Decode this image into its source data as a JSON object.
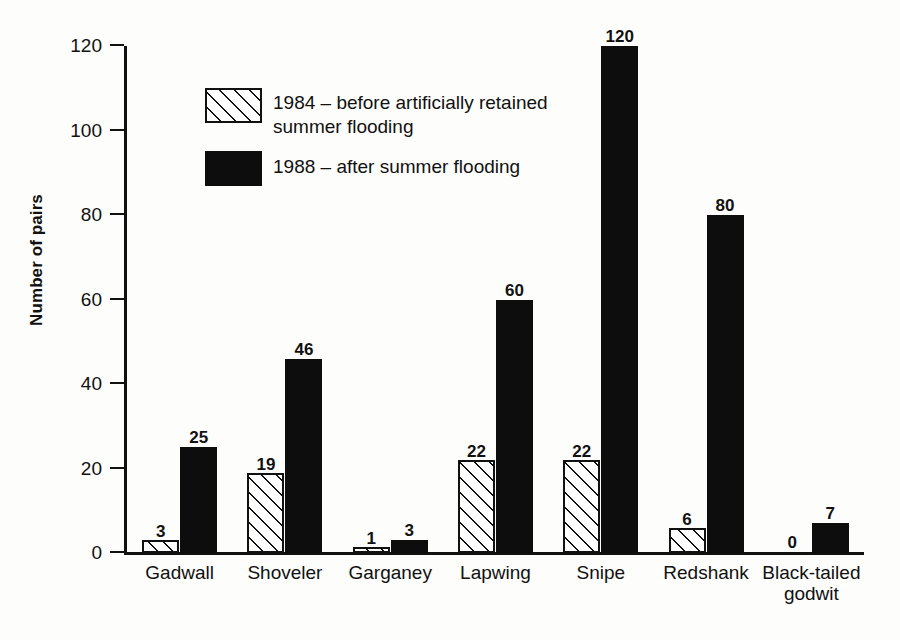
{
  "chart_data": {
    "type": "bar",
    "title": "",
    "xlabel": "",
    "ylabel": "Number of pairs",
    "ylim": [
      0,
      120
    ],
    "yticks": [
      0,
      20,
      40,
      60,
      80,
      100,
      120
    ],
    "grid": false,
    "legend_position": "inside-upper-left",
    "categories": [
      "Gadwall",
      "Shoveler",
      "Garganey",
      "Lapwing",
      "Snipe",
      "Redshank",
      "Black-tailed\ngodwit"
    ],
    "series": [
      {
        "name": "1984 – before artificially retained summer flooding",
        "style": "hatched",
        "values": [
          3,
          19,
          1,
          22,
          22,
          6,
          0
        ]
      },
      {
        "name": "1988 – after summer flooding",
        "style": "filled",
        "values": [
          25,
          46,
          3,
          60,
          120,
          80,
          7
        ]
      }
    ]
  },
  "legend": {
    "items": [
      {
        "label": "1984 – before artificially retained\nsummer flooding",
        "style": "hatched"
      },
      {
        "label": "1988 – after summer flooding",
        "style": "filled"
      }
    ]
  },
  "axis": {
    "y_title": "Number of pairs",
    "y_tick_labels": [
      "0",
      "20",
      "40",
      "60",
      "80",
      "100",
      "120"
    ]
  }
}
